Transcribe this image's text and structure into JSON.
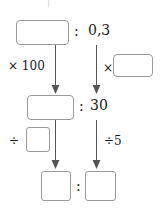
{
  "diagram": {
    "title_mark": "|",
    "rows": [
      {
        "id": "row-1",
        "left_value": "",
        "separator": ":",
        "right_value": "0,3"
      },
      {
        "id": "row-2",
        "left_value": "",
        "separator": ":",
        "right_value": "30"
      },
      {
        "id": "row-3",
        "left_value": "",
        "separator": ":",
        "right_value": ""
      }
    ],
    "operations": [
      {
        "id": "op-left-1",
        "symbol": "×",
        "operand": "100",
        "label": "× 100",
        "has_box": false
      },
      {
        "id": "op-right-1",
        "symbol": "×",
        "operand": "",
        "label": "×",
        "has_box": true
      },
      {
        "id": "op-left-2",
        "symbol": "÷",
        "operand": "",
        "label": "÷",
        "has_box": true
      },
      {
        "id": "op-right-2",
        "symbol": "÷",
        "operand": "5",
        "label": "÷5",
        "has_box": false
      }
    ],
    "arrows": [
      {
        "id": "arrow-left-top",
        "direction": "down"
      },
      {
        "id": "arrow-right-top",
        "direction": "down"
      },
      {
        "id": "arrow-left-bottom",
        "direction": "down"
      },
      {
        "id": "arrow-right-bottom",
        "direction": "down"
      }
    ],
    "colors": {
      "box_border": "#9a9a9a",
      "arrow": "#555555",
      "text": "#1a1a1a",
      "background": "#ffffff"
    }
  }
}
